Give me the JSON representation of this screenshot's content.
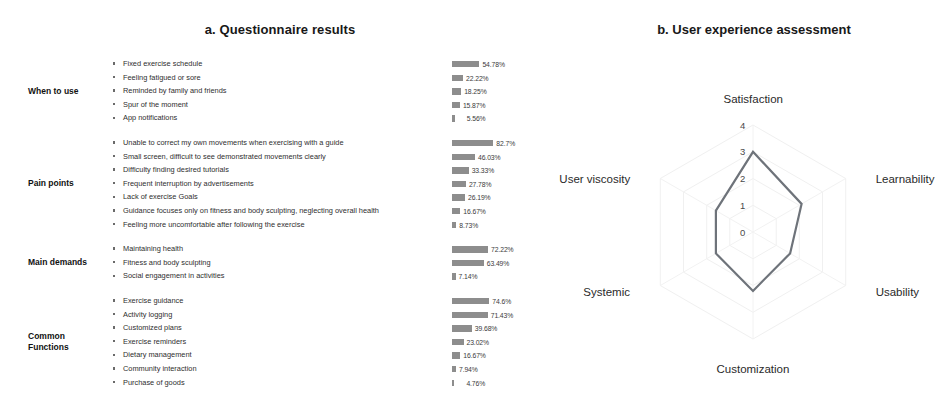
{
  "panel_a": {
    "title": "a. Questionnaire results",
    "groups": [
      {
        "label": "When to use",
        "rows": [
          {
            "text": "Fixed exercise schedule",
            "value": 54.78,
            "value_label": "54.78%"
          },
          {
            "text": "Feeling fatigued or sore",
            "value": 22.22,
            "value_label": "22.22%"
          },
          {
            "text": "Reminded by family and friends",
            "value": 18.25,
            "value_label": "18.25%"
          },
          {
            "text": "Spur of the moment",
            "value": 15.87,
            "value_label": "15.87%"
          },
          {
            "text": "App notifications",
            "value": 5.56,
            "value_label": "5.56%"
          }
        ]
      },
      {
        "label": "Pain points",
        "rows": [
          {
            "text": "Unable to correct my own movements when exercising with a guide",
            "value": 82.7,
            "value_label": "82.7%"
          },
          {
            "text": "Small screen, difficult to see demonstrated movements clearly",
            "value": 46.03,
            "value_label": "46.03%"
          },
          {
            "text": "Difficulty finding desired tutorials",
            "value": 33.33,
            "value_label": "33.33%"
          },
          {
            "text": "Frequent interruption by advertisements",
            "value": 27.78,
            "value_label": "27.78%"
          },
          {
            "text": "Lack of exercise Goals",
            "value": 26.19,
            "value_label": "26.19%"
          },
          {
            "text": "Guidance focuses only on fitness and body sculpting, neglecting overall health",
            "value": 16.67,
            "value_label": "16.67%"
          },
          {
            "text": "Feeling more uncomfortable after following the exercise",
            "value": 8.73,
            "value_label": "8.73%"
          }
        ]
      },
      {
        "label": "Main demands",
        "rows": [
          {
            "text": "Maintaining health",
            "value": 72.22,
            "value_label": "72.22%"
          },
          {
            "text": "Fitness and body sculpting",
            "value": 63.49,
            "value_label": "63.49%"
          },
          {
            "text": "Social engagement in activities",
            "value": 7.14,
            "value_label": "7.14%"
          }
        ]
      },
      {
        "label": "Common Functions",
        "rows": [
          {
            "text": "Exercise guidance",
            "value": 74.6,
            "value_label": "74.6%"
          },
          {
            "text": "Activity logging",
            "value": 71.43,
            "value_label": "71.43%"
          },
          {
            "text": "Customized plans",
            "value": 39.68,
            "value_label": "39.68%"
          },
          {
            "text": "Exercise reminders",
            "value": 23.02,
            "value_label": "23.02%"
          },
          {
            "text": "Dietary management",
            "value": 16.67,
            "value_label": "16.67%"
          },
          {
            "text": "Community interaction",
            "value": 7.94,
            "value_label": "7.94%"
          },
          {
            "text": "Purchase of goods",
            "value": 4.76,
            "value_label": "4.76%"
          }
        ]
      }
    ]
  },
  "panel_b": {
    "title": "b. User experience assessment"
  },
  "chart_data": [
    {
      "type": "bar",
      "title": "a. Questionnaire results",
      "xlabel": "",
      "ylabel": "",
      "xlim": [
        0,
        100
      ],
      "grid": false,
      "orientation": "horizontal",
      "value_unit": "%",
      "categories": [
        "Fixed exercise schedule",
        "Feeling fatigued or sore",
        "Reminded by family and friends",
        "Spur of the moment",
        "App notifications",
        "Unable to correct my own movements when exercising with a guide",
        "Small screen, difficult to see demonstrated movements clearly",
        "Difficulty finding desired tutorials",
        "Frequent interruption by advertisements",
        "Lack of exercise Goals",
        "Guidance focuses only on fitness and body sculpting, neglecting overall health",
        "Feeling more uncomfortable after following the exercise",
        "Maintaining health",
        "Fitness and body sculpting",
        "Social engagement in activities",
        "Exercise guidance",
        "Activity logging",
        "Customized plans",
        "Exercise reminders",
        "Dietary management",
        "Community interaction",
        "Purchase of goods"
      ],
      "values": [
        54.78,
        22.22,
        18.25,
        15.87,
        5.56,
        82.7,
        46.03,
        33.33,
        27.78,
        26.19,
        16.67,
        8.73,
        72.22,
        63.49,
        7.14,
        74.6,
        71.43,
        39.68,
        23.02,
        16.67,
        7.94,
        4.76
      ],
      "groups": [
        "When to use",
        "Pain points",
        "Main demands",
        "Common Functions"
      ],
      "bar_color": "#8d8d8d"
    },
    {
      "type": "radar",
      "title": "b. User experience assessment",
      "categories": [
        "Satisfaction",
        "Learnability",
        "Usability",
        "Customization",
        "Systemic",
        "User viscosity"
      ],
      "values": [
        3.0,
        2.1,
        1.6,
        2.2,
        1.6,
        1.6
      ],
      "tick_labels": [
        "0",
        "1",
        "2",
        "3",
        "4"
      ],
      "rlim": [
        0,
        4
      ],
      "grid": true,
      "line_color": "#6e737a"
    }
  ]
}
